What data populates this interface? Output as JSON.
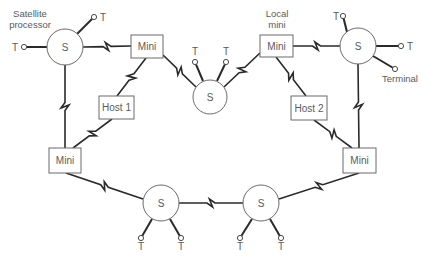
{
  "diagram": {
    "annotations": [
      {
        "id": "satellite-processor-label",
        "lines": [
          "Satellite",
          "processor"
        ],
        "x": 30,
        "y": 17
      },
      {
        "id": "local-mini-label",
        "lines": [
          "Local",
          "mini"
        ],
        "x": 277,
        "y": 17
      },
      {
        "id": "terminal-label",
        "lines": [
          "Terminal"
        ],
        "x": 400,
        "y": 82
      }
    ],
    "satellites": [
      {
        "id": "s-top-left",
        "label": "S",
        "cx": 65,
        "cy": 47,
        "r": 18
      },
      {
        "id": "s-top-center",
        "label": "S",
        "cx": 210,
        "cy": 97,
        "r": 17
      },
      {
        "id": "s-top-right",
        "label": "S",
        "cx": 358,
        "cy": 46,
        "r": 18
      },
      {
        "id": "s-bottom-left",
        "label": "S",
        "cx": 161,
        "cy": 203,
        "r": 18
      },
      {
        "id": "s-bottom-right",
        "label": "S",
        "cx": 261,
        "cy": 203,
        "r": 18
      }
    ],
    "boxes": [
      {
        "id": "mini-top-left",
        "label": "Mini",
        "x": 131,
        "y": 35,
        "w": 32,
        "h": 23
      },
      {
        "id": "mini-top-right",
        "label": "Mini",
        "x": 260,
        "y": 35,
        "w": 33,
        "h": 22
      },
      {
        "id": "host-1",
        "label": "Host 1",
        "x": 99,
        "y": 96,
        "w": 35,
        "h": 23
      },
      {
        "id": "host-2",
        "label": "Host 2",
        "x": 291,
        "y": 96,
        "w": 36,
        "h": 24
      },
      {
        "id": "mini-bottom-left",
        "label": "Mini",
        "x": 49,
        "y": 148,
        "w": 32,
        "h": 25
      },
      {
        "id": "mini-bottom-right",
        "label": "Mini",
        "x": 343,
        "y": 148,
        "w": 33,
        "h": 25
      }
    ],
    "links": [
      {
        "id": "s-tl-to-mini-tl",
        "x1": 83,
        "y1": 47,
        "x2": 131,
        "y2": 46,
        "zig": "h"
      },
      {
        "id": "s-tl-to-mini-bl",
        "x1": 65,
        "y1": 65,
        "x2": 65,
        "y2": 148,
        "zig": "v"
      },
      {
        "id": "mini-tl-to-host1",
        "x1": 146,
        "y1": 58,
        "x2": 117,
        "y2": 96,
        "zig": "d"
      },
      {
        "id": "mini-tl-to-s-center",
        "x1": 163,
        "y1": 55,
        "x2": 196,
        "y2": 87,
        "zig": "d"
      },
      {
        "id": "host1-to-mini-bl",
        "x1": 112,
        "y1": 119,
        "x2": 73,
        "y2": 148,
        "zig": "d"
      },
      {
        "id": "s-center-to-mini-tr",
        "x1": 224,
        "y1": 87,
        "x2": 260,
        "y2": 53,
        "zig": "d"
      },
      {
        "id": "mini-tr-to-s-tr",
        "x1": 293,
        "y1": 46,
        "x2": 340,
        "y2": 46,
        "zig": "h"
      },
      {
        "id": "mini-tr-to-host2",
        "x1": 276,
        "y1": 57,
        "x2": 306,
        "y2": 96,
        "zig": "d"
      },
      {
        "id": "s-tr-to-mini-br",
        "x1": 358,
        "y1": 64,
        "x2": 359,
        "y2": 148,
        "zig": "v"
      },
      {
        "id": "host2-to-mini-br",
        "x1": 314,
        "y1": 120,
        "x2": 352,
        "y2": 148,
        "zig": "d"
      },
      {
        "id": "mini-bl-to-s-bl",
        "x1": 66,
        "y1": 173,
        "x2": 143,
        "y2": 199,
        "zig": "d"
      },
      {
        "id": "s-bl-to-s-br",
        "x1": 179,
        "y1": 203,
        "x2": 243,
        "y2": 203,
        "zig": "h"
      },
      {
        "id": "s-br-to-mini-br",
        "x1": 279,
        "y1": 199,
        "x2": 359,
        "y2": 173,
        "zig": "d"
      }
    ],
    "terminals": [
      {
        "id": "t-tl-left",
        "label": "T",
        "fx": 47,
        "fy": 47,
        "tx": 24,
        "ty": 47,
        "lx": 15,
        "ly": 51,
        "anchor": "middle"
      },
      {
        "id": "t-tl-upright",
        "label": "T",
        "fx": 77,
        "fy": 34,
        "tx": 94,
        "ty": 17,
        "lx": 103,
        "ly": 21,
        "anchor": "middle"
      },
      {
        "id": "t-center-left",
        "label": "T",
        "fx": 203,
        "fy": 81,
        "tx": 195,
        "ty": 62,
        "lx": 195,
        "ly": 55,
        "anchor": "middle"
      },
      {
        "id": "t-center-right",
        "label": "T",
        "fx": 217,
        "fy": 81,
        "tx": 226,
        "ty": 62,
        "lx": 226,
        "ly": 55,
        "anchor": "middle"
      },
      {
        "id": "t-tr-upleft",
        "label": "T",
        "fx": 347,
        "fy": 32,
        "tx": 343,
        "ty": 16,
        "lx": 336,
        "ly": 20,
        "anchor": "middle"
      },
      {
        "id": "t-tr-right",
        "label": "T",
        "fx": 376,
        "fy": 46,
        "tx": 401,
        "ty": 46,
        "lx": 410,
        "ly": 50,
        "anchor": "middle"
      },
      {
        "id": "t-tr-terminal",
        "label": "",
        "fx": 373,
        "fy": 56,
        "tx": 395,
        "ty": 69,
        "lx": 0,
        "ly": 0,
        "anchor": "middle"
      },
      {
        "id": "t-bl-left",
        "label": "T",
        "fx": 152,
        "fy": 219,
        "tx": 141,
        "ty": 238,
        "lx": 141,
        "ly": 250,
        "anchor": "middle"
      },
      {
        "id": "t-bl-right",
        "label": "T",
        "fx": 170,
        "fy": 219,
        "tx": 181,
        "ty": 238,
        "lx": 181,
        "ly": 250,
        "anchor": "middle"
      },
      {
        "id": "t-br-left",
        "label": "T",
        "fx": 252,
        "fy": 219,
        "tx": 240,
        "ty": 238,
        "lx": 240,
        "ly": 250,
        "anchor": "middle"
      },
      {
        "id": "t-br-right",
        "label": "T",
        "fx": 270,
        "fy": 219,
        "tx": 281,
        "ty": 238,
        "lx": 281,
        "ly": 250,
        "anchor": "middle"
      }
    ],
    "colors": {
      "line": "#2a2a2a",
      "shape_stroke": "#6a6a6a",
      "text": "#5a5a5a",
      "background": "#ffffff"
    }
  }
}
